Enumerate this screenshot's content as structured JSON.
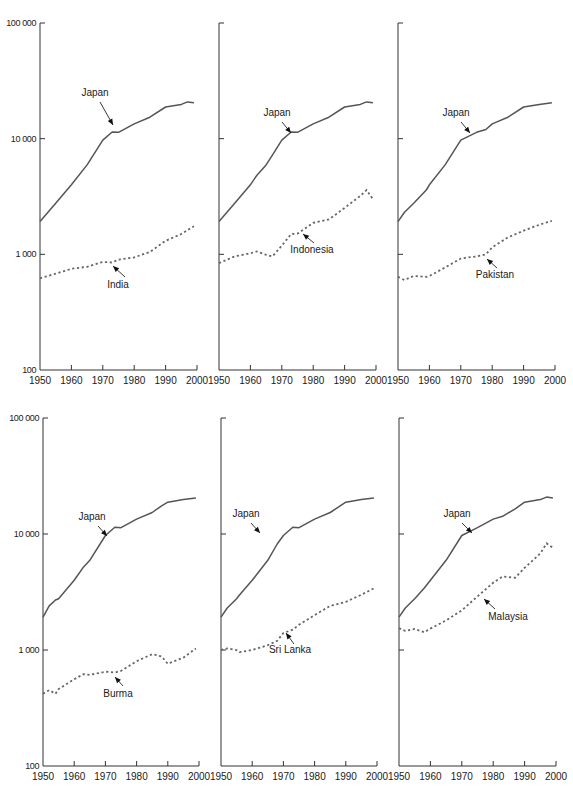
{
  "chart_data": [
    {
      "type": "line",
      "panel": "top-left",
      "y_scale": "log",
      "ylim": [
        100,
        100000
      ],
      "xlim": [
        1950,
        2000
      ],
      "yticks": [
        "100 000",
        "10 000",
        "1 000",
        "100"
      ],
      "xticks": [
        "1950",
        "1960",
        "1970",
        "1980",
        "1990",
        "2000"
      ],
      "show_ytick_labels": true,
      "x": [
        1950,
        1955,
        1960,
        1965,
        1970,
        1973,
        1975,
        1980,
        1985,
        1990,
        1995,
        1997,
        1999
      ],
      "series": [
        {
          "name": "Japan",
          "style": "solid",
          "values": [
            1920,
            2770,
            3990,
            5930,
            9710,
            11430,
            11340,
            13430,
            15330,
            18790,
            19790,
            20800,
            20430
          ],
          "label_pos": [
            95,
            96
          ],
          "arrow_from": [
            100,
            102
          ],
          "arrow_to": [
            113,
            125
          ]
        },
        {
          "name": "India",
          "style": "dashed",
          "values": [
            620,
            680,
            750,
            780,
            860,
            850,
            900,
            940,
            1050,
            1310,
            1500,
            1620,
            1750
          ],
          "label_pos": [
            118,
            288
          ],
          "arrow_from": [
            125,
            277
          ],
          "arrow_to": [
            113,
            266
          ]
        }
      ]
    },
    {
      "type": "line",
      "panel": "top-middle",
      "y_scale": "log",
      "ylim": [
        100,
        100000
      ],
      "xlim": [
        1950,
        2000
      ],
      "xticks": [
        "1950",
        "1960",
        "1970",
        "1980",
        "1990",
        "2000"
      ],
      "show_ytick_labels": false,
      "x": [
        1950,
        1955,
        1960,
        1962,
        1965,
        1967,
        1970,
        1973,
        1975,
        1980,
        1985,
        1990,
        1995,
        1997,
        1999
      ],
      "series": [
        {
          "name": "Japan",
          "style": "solid",
          "values": [
            1920,
            2770,
            3990,
            4800,
            5930,
            7200,
            9710,
            11430,
            11340,
            13430,
            15330,
            18790,
            19790,
            20800,
            20430
          ],
          "label_pos": [
            277,
            116
          ],
          "arrow_from": [
            282,
            122
          ],
          "arrow_to": [
            291,
            133
          ]
        },
        {
          "name": "Indonesia",
          "style": "dashed",
          "values": [
            840,
            960,
            1020,
            1060,
            990,
            960,
            1190,
            1500,
            1510,
            1870,
            2000,
            2520,
            3200,
            3600,
            3000
          ],
          "label_pos": [
            312,
            253
          ],
          "arrow_from": [
            314,
            243
          ],
          "arrow_to": [
            303,
            234
          ]
        }
      ]
    },
    {
      "type": "line",
      "panel": "top-right",
      "y_scale": "log",
      "ylim": [
        100,
        100000
      ],
      "xlim": [
        1950,
        2000
      ],
      "xticks": [
        "1950",
        "1960",
        "1970",
        "1980",
        "1990",
        "2000"
      ],
      "show_ytick_labels": false,
      "x": [
        1950,
        1952,
        1955,
        1959,
        1960,
        1965,
        1970,
        1975,
        1978,
        1980,
        1985,
        1990,
        1995,
        1999
      ],
      "series": [
        {
          "name": "Japan",
          "style": "solid",
          "values": [
            1920,
            2300,
            2770,
            3600,
            3990,
            5930,
            9710,
            11340,
            12000,
            13430,
            15330,
            18790,
            19790,
            20430
          ],
          "label_pos": [
            456,
            116
          ],
          "arrow_from": [
            461,
            122
          ],
          "arrow_to": [
            470,
            133
          ]
        },
        {
          "name": "Pakistan",
          "style": "dashed",
          "values": [
            640,
            600,
            650,
            640,
            650,
            770,
            920,
            960,
            1000,
            1150,
            1400,
            1600,
            1800,
            1950
          ],
          "label_pos": [
            495,
            278
          ],
          "arrow_from": [
            497,
            268
          ],
          "arrow_to": [
            487,
            259
          ]
        }
      ]
    },
    {
      "type": "line",
      "panel": "bottom-left",
      "y_scale": "log",
      "ylim": [
        100,
        100000
      ],
      "xlim": [
        1950,
        2000
      ],
      "yticks": [
        "100 000",
        "10 000",
        "1 000",
        "100"
      ],
      "xticks": [
        "1950",
        "1960",
        "1970",
        "1980",
        "1990",
        "2000"
      ],
      "show_ytick_labels": true,
      "x": [
        1950,
        1952,
        1954,
        1955,
        1960,
        1963,
        1965,
        1970,
        1973,
        1975,
        1980,
        1985,
        1988,
        1990,
        1995,
        1999
      ],
      "series": [
        {
          "name": "Japan",
          "style": "solid",
          "values": [
            1920,
            2400,
            2700,
            2770,
            3990,
            5200,
            5930,
            9710,
            11430,
            11340,
            13430,
            15330,
            17500,
            18790,
            19790,
            20430
          ],
          "label_pos": [
            92,
            520
          ],
          "arrow_from": [
            98,
            526
          ],
          "arrow_to": [
            107,
            536
          ]
        },
        {
          "name": "Burma",
          "style": "dashed",
          "values": [
            420,
            450,
            420,
            460,
            560,
            620,
            610,
            650,
            640,
            660,
            800,
            920,
            880,
            760,
            860,
            1030
          ],
          "label_pos": [
            118,
            697
          ],
          "arrow_from": [
            123,
            686
          ],
          "arrow_to": [
            115,
            677
          ]
        }
      ]
    },
    {
      "type": "line",
      "panel": "bottom-middle",
      "y_scale": "log",
      "ylim": [
        100,
        100000
      ],
      "xlim": [
        1950,
        2000
      ],
      "xticks": [
        "1950",
        "1960",
        "1970",
        "1980",
        "1990",
        "2000"
      ],
      "show_ytick_labels": false,
      "x": [
        1950,
        1952,
        1955,
        1956,
        1960,
        1965,
        1968,
        1970,
        1973,
        1975,
        1980,
        1985,
        1990,
        1995,
        1999
      ],
      "series": [
        {
          "name": "Japan",
          "style": "solid",
          "values": [
            1920,
            2300,
            2770,
            3000,
            3990,
            5930,
            8200,
            9710,
            11430,
            11340,
            13430,
            15330,
            18790,
            19790,
            20430
          ],
          "label_pos": [
            246,
            517
          ],
          "arrow_from": [
            251,
            523
          ],
          "arrow_to": [
            260,
            533
          ]
        },
        {
          "name": "Sri Lanka",
          "style": "dashed",
          "values": [
            1000,
            1030,
            1000,
            960,
            1000,
            1100,
            1200,
            1400,
            1500,
            1650,
            2000,
            2400,
            2600,
            3000,
            3400
          ],
          "label_pos": [
            290,
            653
          ],
          "arrow_from": [
            294,
            644
          ],
          "arrow_to": [
            286,
            633
          ]
        }
      ]
    },
    {
      "type": "line",
      "panel": "bottom-right",
      "y_scale": "log",
      "ylim": [
        100,
        100000
      ],
      "xlim": [
        1950,
        2000
      ],
      "xticks": [
        "1950",
        "1960",
        "1970",
        "1980",
        "1990",
        "2000"
      ],
      "show_ytick_labels": false,
      "x": [
        1950,
        1952,
        1955,
        1958,
        1960,
        1965,
        1970,
        1975,
        1980,
        1983,
        1987,
        1990,
        1995,
        1997,
        1999
      ],
      "series": [
        {
          "name": "Japan",
          "style": "solid",
          "values": [
            1920,
            2300,
            2770,
            3400,
            3990,
            5930,
            9710,
            11340,
            13430,
            14200,
            16500,
            18790,
            19790,
            20800,
            20430
          ],
          "label_pos": [
            457,
            517
          ],
          "arrow_from": [
            462,
            523
          ],
          "arrow_to": [
            472,
            533
          ]
        },
        {
          "name": "Malaysia",
          "style": "dashed",
          "values": [
            1540,
            1460,
            1520,
            1420,
            1530,
            1800,
            2200,
            2900,
            3800,
            4300,
            4200,
            5100,
            6800,
            8300,
            7600
          ],
          "label_pos": [
            508,
            620
          ],
          "arrow_from": [
            495,
            609
          ],
          "arrow_to": [
            484,
            599
          ]
        }
      ]
    }
  ],
  "layout": {
    "rows": [
      {
        "y_top": 23,
        "y_bottom": 370,
        "tick_label_y": 384
      },
      {
        "y_top": 418,
        "y_bottom": 766,
        "tick_label_y": 780
      }
    ],
    "panels": [
      {
        "row": 0,
        "x_left": 40,
        "x_right": 197
      },
      {
        "row": 0,
        "x_left": 219,
        "x_right": 376
      },
      {
        "row": 0,
        "x_left": 398,
        "x_right": 555
      },
      {
        "row": 1,
        "x_left": 43,
        "x_right": 199
      },
      {
        "row": 1,
        "x_left": 221,
        "x_right": 377
      },
      {
        "row": 1,
        "x_left": 399,
        "x_right": 556
      }
    ]
  }
}
